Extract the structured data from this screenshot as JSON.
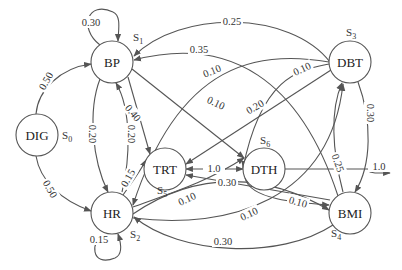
{
  "title": "",
  "nodes": [
    {
      "id": "DIG",
      "label": "DIG",
      "state": "S",
      "state_sub": "0"
    },
    {
      "id": "BP",
      "label": "BP",
      "state": "S",
      "state_sub": "1"
    },
    {
      "id": "HR",
      "label": "HR",
      "state": "S",
      "state_sub": "2"
    },
    {
      "id": "DBT",
      "label": "DBT",
      "state": "S",
      "state_sub": "3"
    },
    {
      "id": "BMI",
      "label": "BMI",
      "state": "S",
      "state_sub": "4"
    },
    {
      "id": "TRT",
      "label": "TRT",
      "state": "S",
      "state_sub": "5"
    },
    {
      "id": "DTH",
      "label": "DTH",
      "state": "S",
      "state_sub": "6"
    }
  ],
  "edges": [
    {
      "from": "BP",
      "to": "BP",
      "label": "0.30"
    },
    {
      "from": "HR",
      "to": "HR",
      "label": "0.15"
    },
    {
      "from": "DIG",
      "to": "BP",
      "label": "0.50"
    },
    {
      "from": "DIG",
      "to": "HR",
      "label": "0.50"
    },
    {
      "from": "BP",
      "to": "HR",
      "label": "0.20"
    },
    {
      "from": "HR",
      "to": "BP",
      "label": "0.20"
    },
    {
      "from": "BP",
      "to": "TRT",
      "label": "0.40"
    },
    {
      "from": "HR",
      "to": "TRT",
      "label": "0.15"
    },
    {
      "from": "DBT",
      "to": "BP",
      "label": "0.25"
    },
    {
      "from": "BMI",
      "to": "BP",
      "label": "0.35"
    },
    {
      "from": "DBT",
      "to": "HR",
      "label": "0.10"
    },
    {
      "from": "BP",
      "to": "DTH",
      "label": "0.10"
    },
    {
      "from": "DBT",
      "to": "TRT",
      "label": "0.20"
    },
    {
      "from": "DBT",
      "to": "DTH",
      "label": "0.10"
    },
    {
      "from": "DTH",
      "to": "TRT",
      "label": "1.0"
    },
    {
      "from": "HR",
      "to": "DTH",
      "label": "0.10"
    },
    {
      "from": "BMI",
      "to": "TRT",
      "label": "0.05"
    },
    {
      "from": "HR",
      "to": "BMI",
      "label": "0.30"
    },
    {
      "from": "BMI",
      "to": "HR",
      "label": "0.30"
    },
    {
      "from": "HR",
      "to": "DBT",
      "label": "0.10"
    },
    {
      "from": "DTH",
      "to": "BMI",
      "label": "0.10"
    },
    {
      "from": "BMI",
      "to": "DBT",
      "label": "0.25"
    },
    {
      "from": "DBT",
      "to": "BMI",
      "label": "0.30"
    },
    {
      "from": "DTH",
      "to": "exit",
      "label": "1.0"
    }
  ]
}
